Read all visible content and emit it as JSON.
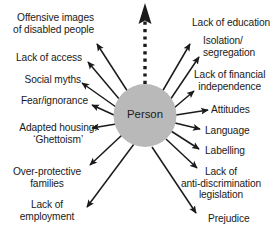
{
  "diagram": {
    "type": "radial-spoke",
    "center": {
      "label": "Person",
      "shape": "circle",
      "fill_color": "#b9b9b9"
    },
    "arrow_color": "#1a1a1a",
    "background_color": "#ffffff",
    "vertical_arrow": {
      "name": "dotted-up-arrow",
      "style": "dotted",
      "direction": "up"
    },
    "spokes_left": [
      {
        "id": "offensive-images",
        "lines": [
          "Offensive images",
          "of disabled people"
        ]
      },
      {
        "id": "lack-of-access",
        "lines": [
          "Lack of access"
        ]
      },
      {
        "id": "social-myths",
        "lines": [
          "Social myths"
        ]
      },
      {
        "id": "fear-ignorance",
        "lines": [
          "Fear/ignorance"
        ]
      },
      {
        "id": "adapted-housing",
        "lines": [
          "Adapted housing:",
          "‘Ghettoism’"
        ]
      },
      {
        "id": "over-protective-families",
        "lines": [
          "Over-protective",
          "families"
        ]
      },
      {
        "id": "lack-of-employment",
        "lines": [
          "Lack of",
          "employment"
        ]
      }
    ],
    "spokes_right": [
      {
        "id": "lack-of-education",
        "lines": [
          "Lack of education"
        ]
      },
      {
        "id": "isolation-segregation",
        "lines": [
          "Isolation/",
          "segregation"
        ]
      },
      {
        "id": "lack-of-financial-independence",
        "lines": [
          "Lack of financial",
          "independence"
        ]
      },
      {
        "id": "attitudes",
        "lines": [
          "Attitudes"
        ]
      },
      {
        "id": "language",
        "lines": [
          "Language"
        ]
      },
      {
        "id": "labelling",
        "lines": [
          "Labelling"
        ]
      },
      {
        "id": "lack-of-anti-discrimination-legislation",
        "lines": [
          "Lack of",
          "anti-discrimination",
          "legislation"
        ]
      },
      {
        "id": "prejudice",
        "lines": [
          "Prejudice"
        ]
      }
    ]
  }
}
